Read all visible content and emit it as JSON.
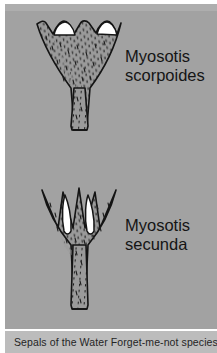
{
  "figure": {
    "caption": "Sepals of the Water Forget-me-not species",
    "background_color": "#a2a2a2",
    "caption_band_color": "#bcbcbc",
    "ink_color": "#1a1a1a",
    "petal_color": "#ffffff"
  },
  "specimens": [
    {
      "id": "scorpoides",
      "genus": "Myosotis",
      "species": "scorpoides",
      "shape": "funnel-shaped calyx with shallow wavy-scalloped rim",
      "lobe_count": 5,
      "white_petal_count": 2
    },
    {
      "id": "secunda",
      "genus": "Myosotis",
      "species": "secunda",
      "shape": "star-shaped calyx with deep narrow pointed lobes",
      "lobe_count": 5,
      "white_petal_count": 2
    }
  ]
}
